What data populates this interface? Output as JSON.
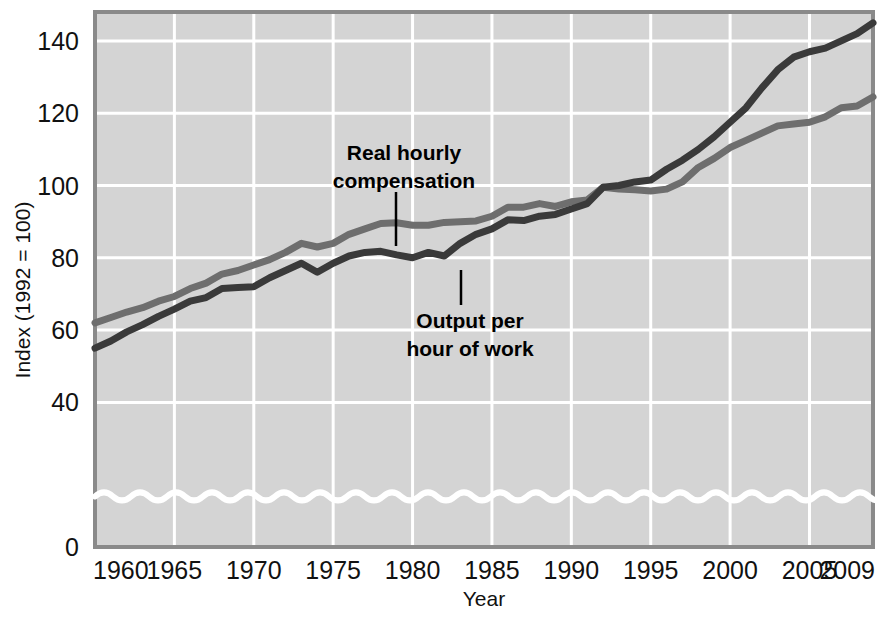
{
  "chart_data": {
    "type": "line",
    "title": "",
    "xlabel": "Year",
    "ylabel": "Index (1992 = 100)",
    "xlim": [
      1960,
      2009
    ],
    "ylim": [
      0,
      148
    ],
    "grid": true,
    "axis_break": true,
    "axis_break_value": 14,
    "legend_position": "inline-annotations",
    "background_color": "#d4d4d4",
    "gridline_color": "#ffffff",
    "xticks": [
      "1960",
      "1965",
      "1970",
      "1975",
      "1980",
      "1985",
      "1990",
      "1995",
      "2000",
      "2005",
      "2009"
    ],
    "xtick_values": [
      1960,
      1965,
      1970,
      1975,
      1980,
      1985,
      1990,
      1995,
      2000,
      2005,
      2009
    ],
    "yticks": [
      "0",
      "40",
      "60",
      "80",
      "100",
      "120",
      "140"
    ],
    "ytick_values": [
      0,
      40,
      60,
      80,
      100,
      120,
      140
    ],
    "x": [
      1960,
      1961,
      1962,
      1963,
      1964,
      1965,
      1966,
      1967,
      1968,
      1969,
      1970,
      1971,
      1972,
      1973,
      1974,
      1975,
      1976,
      1977,
      1978,
      1979,
      1980,
      1981,
      1982,
      1983,
      1984,
      1985,
      1986,
      1987,
      1988,
      1989,
      1990,
      1991,
      1992,
      1993,
      1994,
      1995,
      1996,
      1997,
      1998,
      1999,
      2000,
      2001,
      2002,
      2003,
      2004,
      2005,
      2006,
      2007,
      2008,
      2009
    ],
    "series": [
      {
        "name": "Real hourly compensation",
        "color": "#6e6e6e",
        "annotation": "Real hourly compensation",
        "values": [
          62.0,
          63.5,
          65.0,
          66.2,
          68.0,
          69.3,
          71.5,
          73.0,
          75.5,
          76.5,
          78.0,
          79.5,
          81.5,
          84.0,
          83.0,
          84.0,
          86.5,
          88.0,
          89.5,
          89.7,
          89.0,
          89.0,
          89.8,
          90.0,
          90.2,
          91.5,
          94.0,
          94.0,
          95.0,
          94.2,
          95.5,
          96.0,
          99.5,
          99.0,
          98.8,
          98.5,
          99.0,
          101.0,
          105.0,
          107.5,
          110.5,
          112.5,
          114.5,
          116.5,
          117.0,
          117.5,
          119.0,
          121.5,
          122.0,
          124.5
        ]
      },
      {
        "name": "Output per hour of work",
        "color": "#3a3a3a",
        "annotation": "Output per hour of work",
        "values": [
          55.0,
          57.0,
          59.5,
          61.5,
          63.8,
          65.8,
          68.0,
          69.0,
          71.5,
          71.8,
          72.0,
          74.5,
          76.5,
          78.5,
          76.0,
          78.5,
          80.5,
          81.5,
          81.8,
          80.8,
          80.0,
          81.5,
          80.5,
          84.0,
          86.5,
          88.0,
          90.5,
          90.3,
          91.5,
          92.0,
          93.5,
          95.0,
          99.5,
          100.0,
          101.0,
          101.5,
          104.5,
          107.0,
          110.0,
          113.5,
          117.5,
          121.5,
          127.0,
          132.0,
          135.5,
          137.0,
          138.0,
          140.0,
          142.0,
          145.0
        ]
      }
    ],
    "annotations": [
      {
        "label": "Real hourly compensation",
        "lines": [
          "Real hourly",
          "compensation"
        ],
        "text_x": 404,
        "text_y": 160,
        "leader_x": 396,
        "leader_y1": 192,
        "leader_y2": 246,
        "anchor": "middle"
      },
      {
        "label": "Output per hour of work",
        "lines": [
          "Output per",
          "hour of work"
        ],
        "text_x": 470,
        "text_y": 328,
        "leader_x": 461,
        "leader_y1": 270,
        "leader_y2": 305,
        "anchor": "middle"
      }
    ]
  }
}
